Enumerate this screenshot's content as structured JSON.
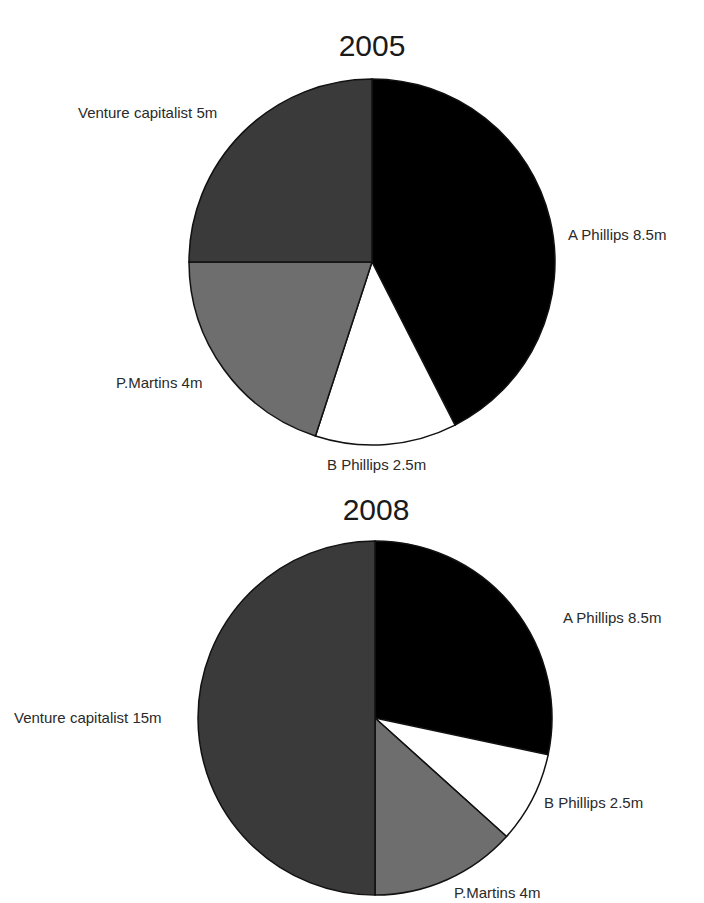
{
  "chart_data": [
    {
      "type": "pie",
      "title": "2005",
      "unit": "m",
      "start_angle_deg": 0,
      "direction": "clockwise",
      "slices": [
        {
          "name": "A Phillips",
          "value": 8.5,
          "label": "A Phillips 8.5m",
          "color": "#000000"
        },
        {
          "name": "B Phillips",
          "value": 2.5,
          "label": "B Phillips 2.5m",
          "color": "#ffffff"
        },
        {
          "name": "P.Martins",
          "value": 4,
          "label": "P.Martins 4m",
          "color": "#6e6e6e"
        },
        {
          "name": "Venture capitalist",
          "value": 5,
          "label": "Venture capitalist 5m",
          "color": "#3a3a3a"
        }
      ],
      "total": 20
    },
    {
      "type": "pie",
      "title": "2008",
      "unit": "m",
      "start_angle_deg": 0,
      "direction": "clockwise",
      "slices": [
        {
          "name": "A Phillips",
          "value": 8.5,
          "label": "A Phillips 8.5m",
          "color": "#000000"
        },
        {
          "name": "B Phillips",
          "value": 2.5,
          "label": "B Phillips 2.5m",
          "color": "#ffffff"
        },
        {
          "name": "P.Martins",
          "value": 4,
          "label": "P.Martins 4m",
          "color": "#6e6e6e"
        },
        {
          "name": "Venture capitalist",
          "value": 15,
          "label": "Venture capitalist 15m",
          "color": "#3a3a3a"
        }
      ],
      "total": 30
    }
  ],
  "charts": {
    "c2005": {
      "title": "2005",
      "labels": {
        "a_phillips": "A Phillips 8.5m",
        "b_phillips": "B Phillips 2.5m",
        "p_martins": "P.Martins 4m",
        "venture": "Venture capitalist 5m"
      }
    },
    "c2008": {
      "title": "2008",
      "labels": {
        "a_phillips": "A Phillips 8.5m",
        "b_phillips": "B Phillips 2.5m",
        "p_martins": "P.Martins 4m",
        "venture": "Venture capitalist 15m"
      }
    }
  }
}
